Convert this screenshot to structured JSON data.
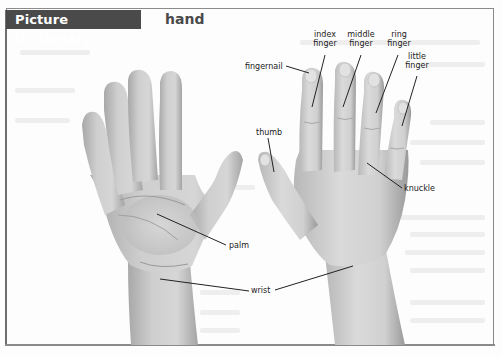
{
  "header": {
    "tab_label": "Picture Dictionary",
    "entry_word": "hand"
  },
  "labels": {
    "index_finger": [
      "index",
      "finger"
    ],
    "middle_finger": [
      "middle",
      "finger"
    ],
    "ring_finger": [
      "ring",
      "finger"
    ],
    "little_finger": [
      "little",
      "finger"
    ],
    "fingernail": "fingernail",
    "thumb": "thumb",
    "knuckle": "knuckle",
    "palm": "palm",
    "wrist": "wrist"
  },
  "colors": {
    "tab_background": "#4a4a4a",
    "tab_text": "#ffffff",
    "frame": "#8a8a8a",
    "skin_light": "#d9d9d9",
    "skin_dark": "#a9a9a9",
    "leader_line": "#222222"
  }
}
